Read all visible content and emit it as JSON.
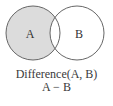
{
  "diagram": {
    "type": "venn",
    "sets": [
      {
        "label": "A",
        "cx": 33,
        "cy": 33,
        "r": 27,
        "shaded": true
      },
      {
        "label": "B",
        "cx": 77,
        "cy": 33,
        "r": 27,
        "shaded": false
      }
    ],
    "shade_color": "#dcdcdc",
    "stroke_color": "#666666",
    "caption": {
      "title": "Difference(A, B)",
      "expression": "A − B"
    }
  }
}
